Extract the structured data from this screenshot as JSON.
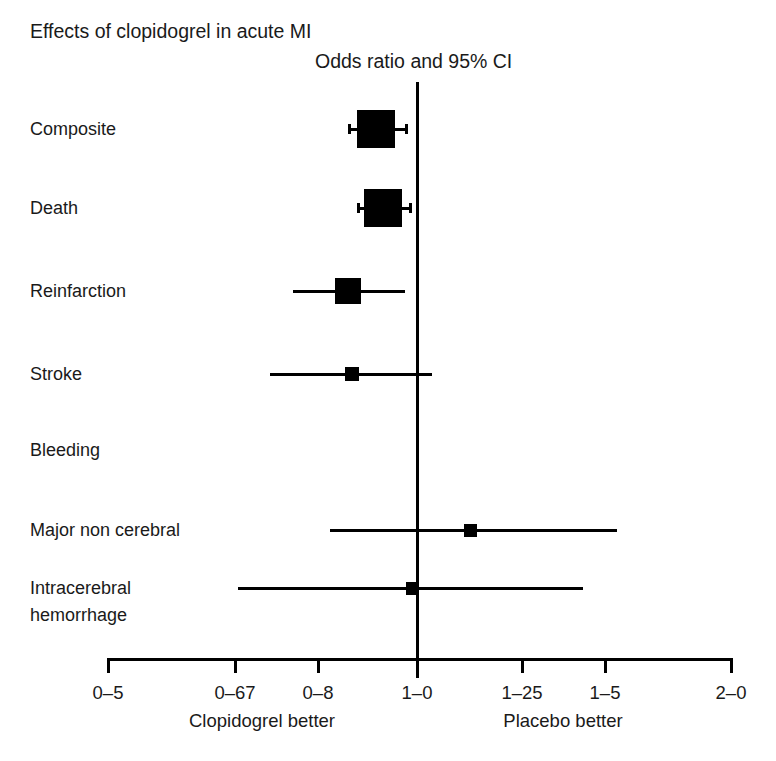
{
  "figure": {
    "title": "Effects of clopidogrel in acute MI",
    "axis_title": "Odds ratio and 95% CI",
    "left_side_label": "Clopidogrel better",
    "right_side_label": "Placebo better"
  },
  "chart_data": {
    "type": "forest",
    "title": "Effects of clopidogrel in acute MI",
    "subtitle": "Odds ratio and 95% CI",
    "xlabel": "Odds ratio and 95% CI",
    "ylabel": "",
    "xscale": "log",
    "xlim": [
      0.5,
      2.0
    ],
    "grid": false,
    "null_value": 1.0,
    "tick_values": [
      0.5,
      0.67,
      0.8,
      1.0,
      1.25,
      1.5,
      2.0
    ],
    "tick_labels": [
      "0–5",
      "0–67",
      "0–8",
      "1–0",
      "1–25",
      "1–5",
      "2–0"
    ],
    "left_annotation": "Clopidogrel better",
    "right_annotation": "Placebo better",
    "categories": [
      "Composite",
      "Death",
      "Reinfarction",
      "Stroke",
      "Bleeding",
      "Major non cerebral",
      "Intracerebral hemorrhage"
    ],
    "rows": [
      {
        "label": "Composite",
        "label_lines": [
          "Composite"
        ],
        "is_header": false,
        "has_marker": true,
        "odds_ratio": 0.91,
        "ci_low": 0.86,
        "ci_high": 0.97,
        "marker_weight": "large"
      },
      {
        "label": "Death",
        "label_lines": [
          "Death"
        ],
        "is_header": false,
        "has_marker": true,
        "odds_ratio": 0.93,
        "ci_low": 0.88,
        "ci_high": 0.99,
        "marker_weight": "large"
      },
      {
        "label": "Reinfarction",
        "label_lines": [
          "Reinfarction"
        ],
        "is_header": false,
        "has_marker": true,
        "odds_ratio": 0.87,
        "ci_low": 0.78,
        "ci_high": 0.97,
        "marker_weight": "medium"
      },
      {
        "label": "Stroke",
        "label_lines": [
          "Stroke"
        ],
        "is_header": false,
        "has_marker": true,
        "odds_ratio": 0.88,
        "ci_low": 0.76,
        "ci_high": 1.02,
        "marker_weight": "small"
      },
      {
        "label": "Bleeding",
        "label_lines": [
          "Bleeding"
        ],
        "is_header": true,
        "has_marker": false,
        "odds_ratio": null,
        "ci_low": null,
        "ci_high": null,
        "marker_weight": "none"
      },
      {
        "label": "Major non cerebral",
        "label_lines": [
          "Major non cerebral"
        ],
        "is_header": false,
        "has_marker": true,
        "odds_ratio": 1.12,
        "ci_low": 0.85,
        "ci_high": 1.5,
        "marker_weight": "xsmall"
      },
      {
        "label": "Intracerebral hemorrhage",
        "label_lines": [
          "Intracerebral",
          "hemorrhage"
        ],
        "is_header": false,
        "has_marker": true,
        "odds_ratio": 0.99,
        "ci_low": 0.67,
        "ci_high": 1.42,
        "marker_weight": "xsmall"
      }
    ]
  },
  "geometry": {
    "axis_x_left": 108,
    "axis_x_right": 731,
    "axis_y": 658,
    "null_x": 417,
    "null_top": 82,
    "null_bottom": 678,
    "tick_x": [
      108,
      235,
      318,
      417,
      522,
      605,
      731
    ],
    "tick_label_y": 682,
    "side_label_y": 710,
    "left_side_label_x": 262,
    "right_side_label_x": 563,
    "label_x": 30,
    "row_y": [
      129,
      208,
      291,
      374,
      450,
      530,
      588
    ],
    "marker_cx": [
      376,
      383,
      348,
      352,
      null,
      470,
      412
    ],
    "marker_size": [
      38,
      38,
      26,
      14,
      0,
      13,
      13
    ],
    "whisker_x0": [
      348,
      357,
      293,
      270,
      null,
      330,
      238
    ],
    "whisker_x1": [
      408,
      412,
      405,
      432,
      null,
      617,
      583
    ],
    "cap_rows": [
      0,
      1
    ]
  }
}
